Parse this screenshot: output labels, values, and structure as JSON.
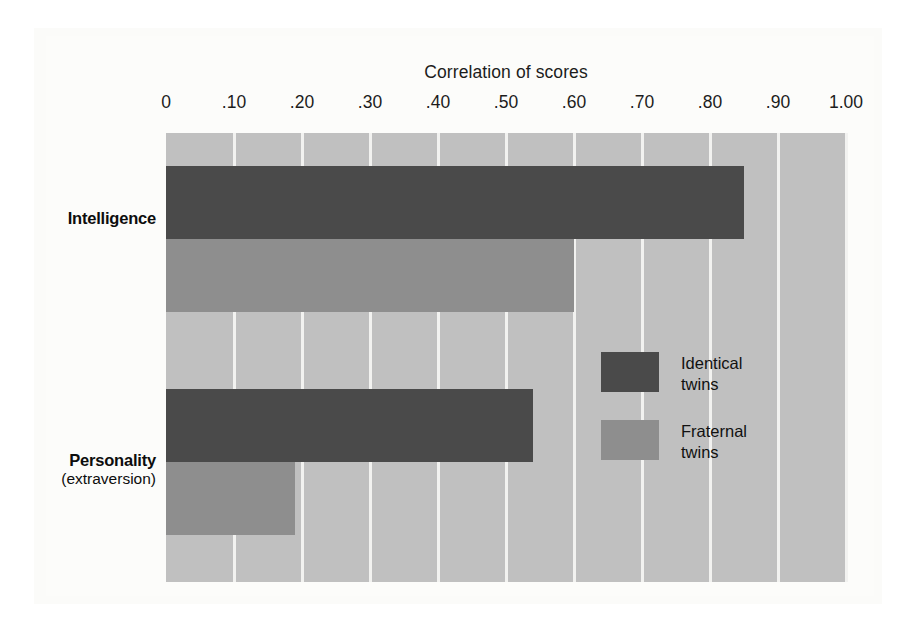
{
  "chart_data": {
    "type": "bar",
    "orientation": "horizontal",
    "title": "Correlation of scores",
    "xlabel": "Correlation of scores",
    "ylabel": "",
    "xlim": [
      0,
      1.0
    ],
    "xticks": [
      "0",
      ".10",
      ".20",
      ".30",
      ".40",
      ".50",
      ".60",
      ".70",
      ".80",
      ".90",
      "1.00"
    ],
    "xtick_values": [
      0,
      0.1,
      0.2,
      0.3,
      0.4,
      0.5,
      0.6,
      0.7,
      0.8,
      0.9,
      1.0
    ],
    "grid": true,
    "legend_position": "inside-right",
    "categories": [
      {
        "name": "Intelligence",
        "sub": ""
      },
      {
        "name": "Personality",
        "sub": "(extraversion)"
      }
    ],
    "series": [
      {
        "name": "Identical twins",
        "color": "#4a4a4a",
        "values": [
          0.85,
          0.54
        ]
      },
      {
        "name": "Fraternal twins",
        "color": "#8e8e8e",
        "values": [
          0.6,
          0.19
        ]
      }
    ],
    "plot_background": "#c0c0c0",
    "gridline_color": "#f2f2f0"
  },
  "legend": {
    "items": [
      {
        "label_line1": "Identical",
        "label_line2": "twins"
      },
      {
        "label_line1": "Fraternal",
        "label_line2": "twins"
      }
    ]
  }
}
